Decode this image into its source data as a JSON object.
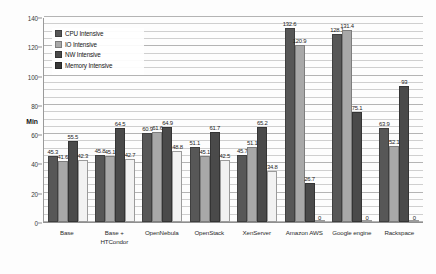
{
  "chart_data": {
    "type": "bar",
    "title": "",
    "xlabel": "",
    "ylabel": "Min",
    "ylim": [
      0,
      140
    ],
    "ytick_step": 20,
    "yticks": [
      "0",
      "20",
      "40",
      "60",
      "80",
      "100",
      "120",
      "140"
    ],
    "grid": true,
    "minor_grid": true,
    "legend_position": "top-left-inside",
    "categories": [
      "Base",
      "Base +\nHTCondor",
      "OpenNebula",
      "OpenStack",
      "XenServer",
      "Amazon AWS",
      "Google engine",
      "Rackspace"
    ],
    "category_lines": [
      [
        "Base"
      ],
      [
        "Base +",
        "HTCondor"
      ],
      [
        "OpenNebula"
      ],
      [
        "OpenStack"
      ],
      [
        "XenServer"
      ],
      [
        "Amazon AWS"
      ],
      [
        "Google engine"
      ],
      [
        "Rackspace"
      ]
    ],
    "series": [
      {
        "name": "CPU Intensive",
        "color": "#575757",
        "values": [
          45.3,
          45.8,
          60.9,
          51.1,
          45.7,
          132.6,
          128.1,
          63.9
        ],
        "labels": [
          "45.3",
          "45.8",
          "60.9",
          "51.1",
          "45.7",
          "132.6",
          "128.1",
          "63.9"
        ]
      },
      {
        "name": "IO Intensive",
        "color": "#a8a8a8",
        "values": [
          41.6,
          45.1,
          61.6,
          45.1,
          51.1,
          120.9,
          131.4,
          52.1
        ],
        "labels": [
          "41.6",
          "45.1",
          "61.6",
          "45.1",
          "51.1",
          "120.9",
          "131.4",
          "52.1"
        ]
      },
      {
        "name": "NW Intensive",
        "color": "#4a4a4a",
        "values": [
          55.5,
          64.5,
          64.9,
          61.7,
          65.2,
          26.7,
          75.1,
          93
        ],
        "labels": [
          "55.5",
          "64.5",
          "64.9",
          "61.7",
          "65.2",
          "26.7",
          "75.1",
          "93"
        ]
      },
      {
        "name": "Memory Intensive",
        "color": "#f2f2f2",
        "values": [
          42.3,
          42.7,
          48.8,
          42.5,
          34.8,
          0,
          0,
          0
        ],
        "labels": [
          "42.3",
          "42.7",
          "48.8",
          "42.5",
          "34.8",
          "0",
          "0",
          "0"
        ]
      }
    ]
  }
}
